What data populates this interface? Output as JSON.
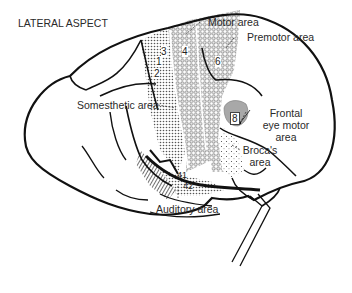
{
  "title": "LATERAL ASPECT",
  "labels": {
    "motor_area": "Motor area",
    "premotor_area": "Premotor area",
    "somesthetic_area": "Somesthetic area",
    "frontal_eye_motor_area_line1": "Frontal",
    "frontal_eye_motor_area_line2": "eye motor",
    "frontal_eye_motor_area_line3": "area",
    "brocas_area_line1": "Broca's",
    "brocas_area_line2": "area",
    "auditory_area": "Auditory area"
  },
  "brodmann_numbers": {
    "a3": "3",
    "a1": "1",
    "a2": "2",
    "a4": "4",
    "a6": "6",
    "a8": "8",
    "a41": "41",
    "a42": "42"
  },
  "colors": {
    "outline": "#111111",
    "shade_dark": "#9a9a9a",
    "eye_field": "#a8a8a8",
    "text": "#2a2a2a"
  }
}
